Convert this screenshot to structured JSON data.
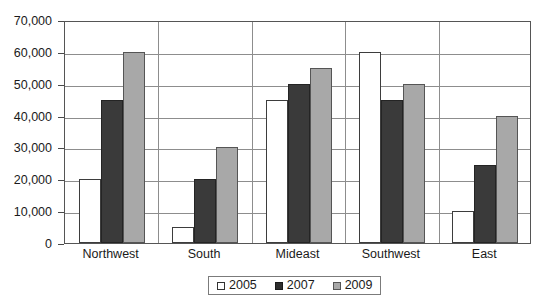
{
  "chart_data": {
    "type": "bar",
    "title": "",
    "xlabel": "",
    "ylabel": "",
    "ylim": [
      0,
      70000
    ],
    "ytick_step": 10000,
    "ytick_labels": [
      "0",
      "10,000",
      "20,000",
      "30,000",
      "40,000",
      "50,000",
      "60,000",
      "70,000"
    ],
    "ytick_values": [
      0,
      10000,
      20000,
      30000,
      40000,
      50000,
      60000,
      70000
    ],
    "grid": true,
    "legend_position": "bottom",
    "categories": [
      "Northwest",
      "South",
      "Mideast",
      "Southwest",
      "East"
    ],
    "series": [
      {
        "name": "2005",
        "color": "#ffffff",
        "values": [
          20000,
          5000,
          45000,
          60000,
          10000
        ]
      },
      {
        "name": "2007",
        "color": "#3a3a3a",
        "values": [
          45000,
          20000,
          50000,
          45000,
          24500
        ]
      },
      {
        "name": "2009",
        "color": "#a8a8a8",
        "values": [
          60000,
          30000,
          55000,
          50000,
          40000
        ]
      }
    ]
  },
  "legend": {
    "items": [
      {
        "label": "2005"
      },
      {
        "label": "2007"
      },
      {
        "label": "2009"
      }
    ]
  }
}
